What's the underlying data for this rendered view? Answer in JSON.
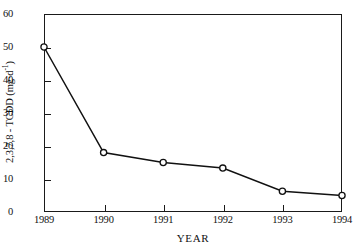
{
  "chart_data": {
    "type": "line",
    "title": "",
    "xlabel": "YEAR",
    "ylabel": "2,3,7,8 - TCDD (mg·d",
    "ylabel_sup": "-1",
    "ylabel_tail": ")",
    "categories": [
      "1989",
      "1990",
      "1991",
      "1992",
      "1993",
      "1994"
    ],
    "values": [
      50,
      18,
      15,
      13.3,
      6.3,
      5
    ],
    "series": [
      {
        "name": "2,3,7,8 - TCDD",
        "values": [
          50,
          18,
          15,
          13.3,
          6.3,
          5
        ]
      }
    ],
    "ylim": [
      0,
      60
    ],
    "yticks": [
      0,
      10,
      20,
      30,
      40,
      50,
      60
    ],
    "ytick_labels": [
      "0",
      "10",
      "20",
      "30",
      "40",
      "50",
      "60"
    ],
    "xtick_labels": [
      "1989",
      "1990",
      "1991",
      "1992",
      "1993",
      "1994"
    ],
    "grid": false,
    "legend": false,
    "marker": "open-circle",
    "line_color": "#111111",
    "marker_fill": "#ffffff",
    "frame": "box"
  }
}
